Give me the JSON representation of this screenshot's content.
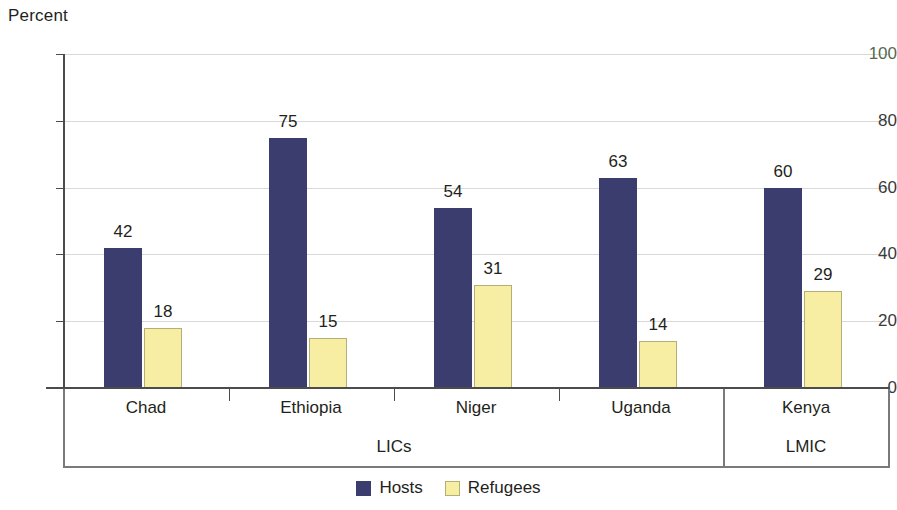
{
  "chart_data": {
    "type": "bar",
    "title": "",
    "subtitle": "",
    "ylabel": "Percent",
    "xlabel": "",
    "ylim": [
      0,
      100
    ],
    "yticks": [
      0,
      20,
      40,
      60,
      80,
      100
    ],
    "ytick_labels": [
      "0",
      "20",
      "40",
      "60",
      "80",
      "100"
    ],
    "grid": true,
    "legend_position": "bottom-center",
    "categories": [
      "Chad",
      "Ethiopia",
      "Niger",
      "Uganda",
      "Kenya"
    ],
    "series": [
      {
        "name": "Hosts",
        "color": "#3b3d6e",
        "values": [
          42,
          75,
          54,
          63,
          60
        ]
      },
      {
        "name": "Refugees",
        "color": "#f7eea3",
        "values": [
          18,
          15,
          31,
          14,
          29
        ]
      }
    ],
    "groups": [
      {
        "label": "LICs",
        "categories": [
          "Chad",
          "Ethiopia",
          "Niger",
          "Uganda"
        ]
      },
      {
        "label": "LMIC",
        "categories": [
          "Kenya"
        ]
      }
    ],
    "data_labels": [
      {
        "category": "Chad",
        "hosts": "42",
        "refugees": "18"
      },
      {
        "category": "Ethiopia",
        "hosts": "75",
        "refugees": "15"
      },
      {
        "category": "Niger",
        "hosts": "54",
        "refugees": "31"
      },
      {
        "category": "Uganda",
        "hosts": "63",
        "refugees": "14"
      },
      {
        "category": "Kenya",
        "hosts": "60",
        "refugees": "29"
      }
    ]
  },
  "axis": {
    "y_title": "Percent",
    "tick_100": "100",
    "tick_80": "80",
    "tick_60": "60",
    "tick_40": "40",
    "tick_20": "20",
    "tick_0": "0"
  },
  "categories": {
    "chad": "Chad",
    "ethiopia": "Ethiopia",
    "niger": "Niger",
    "uganda": "Uganda",
    "kenya": "Kenya"
  },
  "groups": {
    "lics": "LICs",
    "lmic": "LMIC"
  },
  "values": {
    "chad_hosts": "42",
    "chad_refugees": "18",
    "ethiopia_hosts": "75",
    "ethiopia_refugees": "15",
    "niger_hosts": "54",
    "niger_refugees": "31",
    "uganda_hosts": "63",
    "uganda_refugees": "14",
    "kenya_hosts": "60",
    "kenya_refugees": "29"
  },
  "legend": {
    "hosts": "Hosts",
    "refugees": "Refugees"
  },
  "colors": {
    "hosts": "#3b3d6e",
    "refugees": "#f7eea3",
    "refugees_border": "#b4ae77",
    "gridline": "#d9d9d9",
    "axis": "#4c4c4c"
  }
}
